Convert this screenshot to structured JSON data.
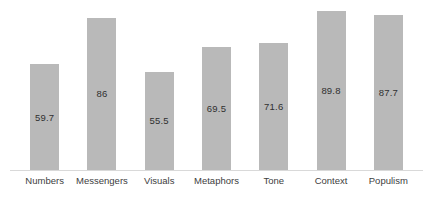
{
  "chart_data": {
    "type": "bar",
    "title": "",
    "categories": [
      "Numbers",
      "Messengers",
      "Visuals",
      "Metaphors",
      "Tone",
      "Context",
      "Populism"
    ],
    "values": [
      59.7,
      86,
      55.5,
      69.5,
      71.6,
      89.8,
      87.7
    ],
    "data_labels": [
      "59.7",
      "86",
      "55.5",
      "69.5",
      "71.6",
      "89.8",
      "87.7"
    ],
    "data_label_position": "inside-center",
    "xlabel": "",
    "ylabel": "",
    "ylim": [
      0,
      96
    ],
    "yaxis_visible": false,
    "xaxis_line_visible": true,
    "grid": false,
    "legend": false,
    "bar_color": "#b9b9b9",
    "baseline_color": "#d9d9d9",
    "label_color": "#404040",
    "background_color": "#ffffff"
  }
}
